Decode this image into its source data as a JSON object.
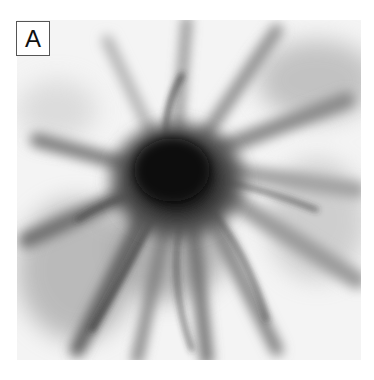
{
  "figure": {
    "panel_label": "A",
    "colors": {
      "background": "#ffffff",
      "core": "#111111",
      "filaments": "#6a6a6a",
      "field": "#f4f4f4"
    }
  }
}
